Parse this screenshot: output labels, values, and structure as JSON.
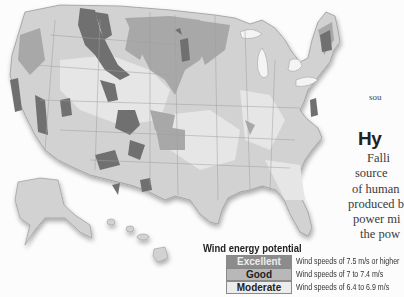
{
  "map": {
    "title": "United States wind energy potential map",
    "colors": {
      "excellent": "#6f6f6f",
      "good": "#a9a9a9",
      "moderate": "#dcdcdc",
      "land": "#d0d0d0",
      "water": "#fcfcfc"
    }
  },
  "side_text": {
    "fragment_top": "sou",
    "heading": "Hy",
    "paragraph_lines": [
      "Falli",
      "source",
      "of human",
      "produced b",
      "power mi",
      "the pow"
    ]
  },
  "legend": {
    "title": "Wind energy potential",
    "items": [
      {
        "label": "Excellent",
        "description": "Wind speeds of 7.5 m/s or higher",
        "color": "#8c8c8c"
      },
      {
        "label": "Good",
        "description": "Wind speeds of 7 to 7.4 m/s",
        "color": "#b8b8b8"
      },
      {
        "label": "Moderate",
        "description": "Wind speeds of 6.4 to 6.9 m/s",
        "color": "#ececec"
      }
    ]
  }
}
